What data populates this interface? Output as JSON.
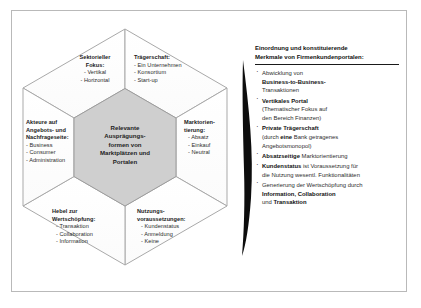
{
  "figure": {
    "center": {
      "lines": [
        "Relevante",
        "Ausprägungs-",
        "formen von",
        "Marktplätzen und",
        "Portalen"
      ],
      "fill": "#cfcfcf"
    },
    "segments": [
      {
        "name": "sektorieller-fokus",
        "title_lines": [
          "Sektorieller",
          "Fokus:"
        ],
        "items": [
          "- Vertikal",
          "- Horizontal"
        ]
      },
      {
        "name": "traegerschaft",
        "title_lines": [
          "Trägerschaft:"
        ],
        "items": [
          "- Ein Unternehmen",
          "- Konsortium",
          "- Start-up"
        ]
      },
      {
        "name": "marktorientierung",
        "title_lines": [
          "Marktorien-",
          "tierung:"
        ],
        "items": [
          "- Absatz",
          "- Einkauf",
          "- Neutral"
        ]
      },
      {
        "name": "nutzungsvoraussetzungen",
        "title_lines": [
          "Nutzungs-",
          "voraussetzungen:"
        ],
        "items": [
          "- Kundenstatus",
          "- Anmeldung",
          "- Keine"
        ]
      },
      {
        "name": "hebel-zur-wertschoepfung",
        "title_lines": [
          "Hebel zur",
          "Wertschöpfung:"
        ],
        "items": [
          "- Transaktion",
          "- Collaboration",
          "- Information"
        ]
      },
      {
        "name": "akteure",
        "title_lines": [
          "Akteure auf",
          "Angebots- und",
          "Nachfrageseite:"
        ],
        "items": [
          "- Business",
          "- Consumer",
          "- Administration"
        ]
      }
    ]
  },
  "arrow": {
    "name": "lens-arrow",
    "color": "#0d0d0d"
  },
  "panel": {
    "title_lines": [
      "Einordnung und konstituierende",
      "Merkmale von Firmenkundenportalen:"
    ],
    "bullets": [
      {
        "lines": [
          [
            {
              "t": "Abwicklung von",
              "b": false
            }
          ],
          [
            {
              "t": "Business-to-Business-",
              "b": true
            }
          ],
          [
            {
              "t": "Transaktionen",
              "b": false
            }
          ]
        ]
      },
      {
        "lines": [
          [
            {
              "t": "Vertikales Portal",
              "b": true
            }
          ],
          [
            {
              "t": "(Thematischer Fokus auf",
              "b": false
            }
          ],
          [
            {
              "t": "den Bereich Finanzen)",
              "b": false
            }
          ]
        ]
      },
      {
        "lines": [
          [
            {
              "t": "Private Trägerschaft",
              "b": true
            }
          ],
          [
            {
              "t": "(durch ",
              "b": false
            },
            {
              "t": "eine",
              "b": true
            },
            {
              "t": " Bank getragenes",
              "b": false
            }
          ],
          [
            {
              "t": "Angebotsmonopol)",
              "b": false
            }
          ]
        ]
      },
      {
        "lines": [
          [
            {
              "t": "Absatzseitige",
              "b": true
            },
            {
              "t": " Marktorientierung",
              "b": false
            }
          ]
        ]
      },
      {
        "lines": [
          [
            {
              "t": "Kundenstatus",
              "b": true
            },
            {
              "t": " ist Voraussetzung für",
              "b": false
            }
          ],
          [
            {
              "t": "die Nutzung wesentl. Funktionalitäten",
              "b": false
            }
          ]
        ]
      },
      {
        "lines": [
          [
            {
              "t": "Generierung der Wertschöpfung durch",
              "b": false
            }
          ],
          [
            {
              "t": "Information, Collaboration",
              "b": true
            }
          ],
          [
            {
              "t": "und ",
              "b": false
            },
            {
              "t": "Transaktion",
              "b": true
            }
          ]
        ]
      }
    ]
  },
  "colors": {
    "frame_border": "#b9b9b9",
    "hex_stroke": "#a6a6a6",
    "center_fill": "#cfcfcf",
    "text": "#2b2b2b"
  }
}
